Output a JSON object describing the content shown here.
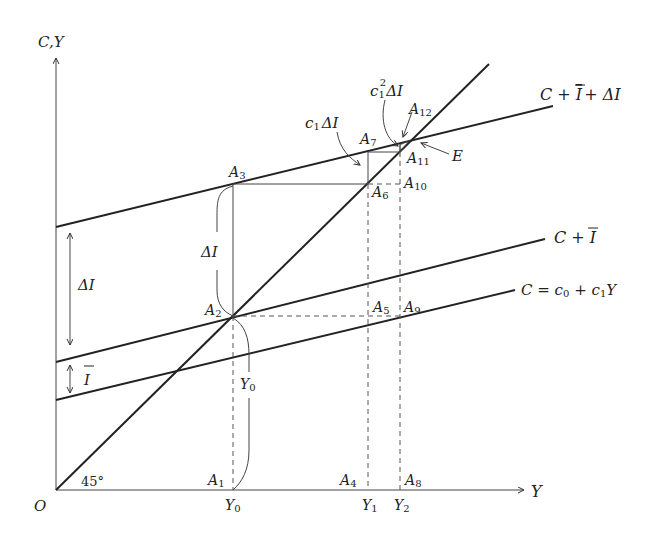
{
  "diagram": {
    "type": "keynesian-cross-multiplier",
    "colors": {
      "ink": "#222222",
      "thin": "#444444",
      "background": "#ffffff"
    },
    "axes": {
      "y_label": "C,Y",
      "x_label": "Y",
      "origin_label": "O",
      "angle_label": "45°"
    },
    "lines": {
      "consumption": {
        "label_main": "C = c",
        "label_sub0": "0",
        "label_mid": " + c",
        "label_sub1": "1",
        "label_tail": "Y"
      },
      "c_plus_i": {
        "label_main": "C + ",
        "label_bar": "I"
      },
      "c_plus_i_plus_di": {
        "label_main": "C + ",
        "label_bar": "I",
        "label_tail": "+ ΔI"
      }
    },
    "points": {
      "A1": {
        "letter": "A",
        "sub": "1"
      },
      "A2": {
        "letter": "A",
        "sub": "2"
      },
      "A3": {
        "letter": "A",
        "sub": "3"
      },
      "A4": {
        "letter": "A",
        "sub": "4"
      },
      "A5": {
        "letter": "A",
        "sub": "5"
      },
      "A6": {
        "letter": "A",
        "sub": "6"
      },
      "A7": {
        "letter": "A",
        "sub": "7"
      },
      "A8": {
        "letter": "A",
        "sub": "8"
      },
      "A9": {
        "letter": "A",
        "sub": "9"
      },
      "A10": {
        "letter": "A",
        "sub": "10"
      },
      "A11": {
        "letter": "A",
        "sub": "11"
      },
      "A12": {
        "letter": "A",
        "sub": "12"
      },
      "E": {
        "letter": "E"
      }
    },
    "x_ticks": {
      "Y0": {
        "letter": "Y",
        "sub": "0"
      },
      "Y1": {
        "letter": "Y",
        "sub": "1"
      },
      "Y2": {
        "letter": "Y",
        "sub": "2"
      }
    },
    "annotations": {
      "delta_i_left": "ΔI",
      "i_bar_left": "I",
      "delta_i_brace": "ΔI",
      "y0_brace": {
        "letter": "Y",
        "sub": "0"
      },
      "c1_delta_i": {
        "c": "c",
        "sub": "1",
        "tail": "ΔI"
      },
      "c1sq_delta_i": {
        "c": "c",
        "sub": "1",
        "sup": "2",
        "tail": "ΔI"
      }
    }
  }
}
